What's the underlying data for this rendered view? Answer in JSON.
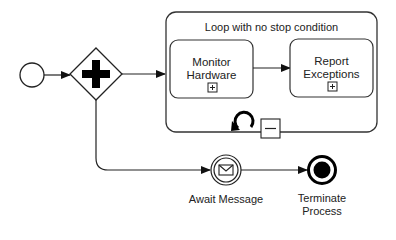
{
  "diagram": {
    "type": "BPMN process",
    "nodes": {
      "start_event": {
        "kind": "start-event",
        "label": ""
      },
      "gateway": {
        "kind": "parallel-gateway",
        "label": ""
      },
      "subprocess": {
        "kind": "looping-subprocess",
        "label": "Loop with no stop condition",
        "markers": [
          "loop-icon",
          "collapse-icon"
        ]
      },
      "task_monitor": {
        "kind": "collapsed-subprocess",
        "label_line1": "Monitor",
        "label_line2": "Hardware",
        "marker": "expand-icon"
      },
      "task_report": {
        "kind": "collapsed-subprocess",
        "label_line1": "Report",
        "label_line2": "Exceptions",
        "marker": "expand-icon"
      },
      "await_message": {
        "kind": "intermediate-message-catch-event",
        "label": "Await Message"
      },
      "terminate": {
        "kind": "terminate-end-event",
        "label_line1": "Terminate",
        "label_line2": "Process"
      }
    },
    "flows": [
      {
        "from": "start_event",
        "to": "gateway"
      },
      {
        "from": "gateway",
        "to": "subprocess"
      },
      {
        "from": "gateway",
        "to": "await_message"
      },
      {
        "from": "task_monitor",
        "to": "task_report"
      },
      {
        "from": "await_message",
        "to": "terminate"
      }
    ],
    "colors": {
      "stroke": "#222222",
      "background": "#ffffff"
    }
  }
}
